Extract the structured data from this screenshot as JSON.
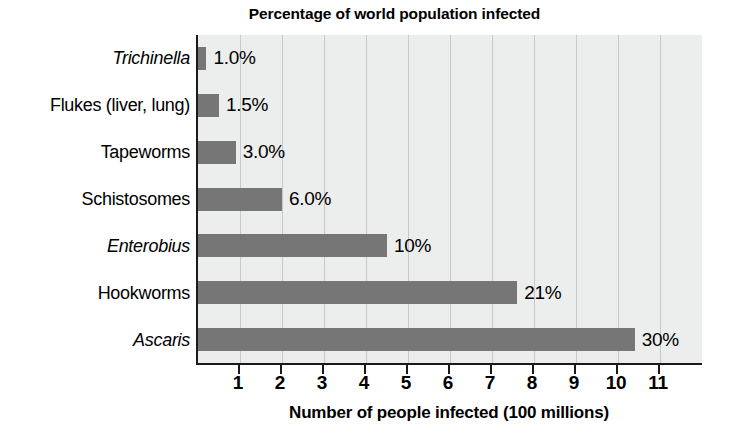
{
  "chart_data": {
    "type": "bar",
    "orientation": "horizontal",
    "title": "Percentage of world population infected",
    "xlabel": "Number of people infected (100 millions)",
    "ylabel": "",
    "xlim": [
      0,
      12
    ],
    "grid": true,
    "legend": null,
    "categories": [
      "Trichinella",
      "Flukes (liver, lung)",
      "Tapeworms",
      "Schistosomes",
      "Enterobius",
      "Hookworms",
      "Ascaris"
    ],
    "category_styles": [
      "italic",
      "normal",
      "normal",
      "normal",
      "italic",
      "normal",
      "italic"
    ],
    "values": [
      0.2,
      0.5,
      0.9,
      2.0,
      4.5,
      7.6,
      10.4
    ],
    "data_labels": [
      "1.0%",
      "1.5%",
      "3.0%",
      "6.0%",
      "10%",
      "21%",
      "30%"
    ],
    "xticks": [
      1,
      2,
      3,
      4,
      5,
      6,
      7,
      8,
      9,
      10,
      11
    ],
    "xtick_labels": [
      "1",
      "2",
      "3",
      "4",
      "5",
      "6",
      "7",
      "8",
      "9",
      "10",
      "11"
    ],
    "bar_color": "#767676",
    "plot_background": "#eceded",
    "axis_color": "#1a1a1a",
    "gridline_color": "#c6c8c9"
  }
}
